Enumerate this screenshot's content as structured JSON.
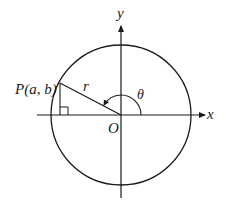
{
  "diagram": {
    "labels": {
      "x_axis": "x",
      "y_axis": "y",
      "origin": "O",
      "point": "P(a, b)",
      "radius": "r",
      "angle": "θ"
    },
    "geometry": {
      "center": [
        121,
        115
      ],
      "radius": 70,
      "point": [
        60,
        83
      ],
      "foot": [
        60,
        115
      ]
    },
    "colors": {
      "stroke": "#1a1a1a",
      "background": "#ffffff"
    }
  }
}
